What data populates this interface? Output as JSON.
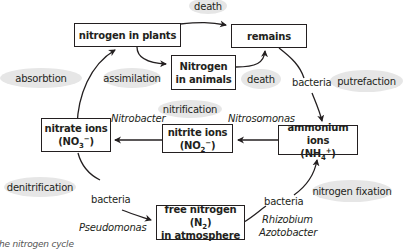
{
  "diagram": {
    "caption": "he nitrogen cycle",
    "boxes": {
      "plants": "nitrogen in plants",
      "remains": "remains",
      "animals_1": "Nitrogen",
      "animals_2": "in animals",
      "nitrate_1": "nitrate ions",
      "nitrate_formula": "(NO",
      "nitrate_sub": "3",
      "nitrate_sup": "−",
      "nitrate_close": ")",
      "nitrite_1": "nitrite ions",
      "nitrite_formula": "(NO",
      "nitrite_sub": "2",
      "nitrite_sup": "−",
      "nitrite_close": ")",
      "ammonium_1": "ammonium ions",
      "ammonium_formula": "(NH",
      "ammonium_sub": "4",
      "ammonium_sup": "+",
      "ammonium_close": ")",
      "free_n_1a": "free nitrogen (N",
      "free_n_sub": "2",
      "free_n_1b": ")",
      "free_n_2": "in atmosphere"
    },
    "processes": {
      "death_top": "death",
      "absorbtion": "absorbtion",
      "assimilation": "assimilation",
      "death_mid": "death",
      "putrefaction": "putrefaction",
      "nitrification": "nitrification",
      "denitrification": "denitrification",
      "nitrogen_fixation": "nitrogen fixation"
    },
    "labels": {
      "bacteria_putrefaction": "bacteria",
      "nitrobacter": "Nitrobacter",
      "nitrosomonas": "Nitrosomonas",
      "bacteria_denitrification": "bacteria",
      "pseudomonas": "Pseudomonas",
      "bacteria_fixation": "bacteria",
      "rhizobium": "Rhizobium",
      "azotobacter": "Azotobacter"
    },
    "colors": {
      "ellipse_fill": "#e6e6e6",
      "line": "#231f20",
      "background": "#ffffff"
    }
  }
}
